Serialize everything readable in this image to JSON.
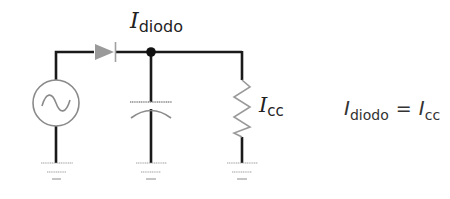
{
  "diagram": {
    "components": [
      {
        "id": "ac-source",
        "type": "ac_voltage_source"
      },
      {
        "id": "diode",
        "type": "diode"
      },
      {
        "id": "junction",
        "type": "node"
      },
      {
        "id": "capacitor",
        "type": "polarized_capacitor"
      },
      {
        "id": "load-resistor",
        "type": "resistor"
      },
      {
        "id": "ground-1",
        "type": "ground"
      },
      {
        "id": "ground-2",
        "type": "ground"
      },
      {
        "id": "ground-3",
        "type": "ground"
      }
    ],
    "colors": {
      "wire": "#1a1a1a",
      "component": "#8a8a8a"
    }
  },
  "labels": {
    "i_diodo": {
      "symbol": "I",
      "subscript": "diodo"
    },
    "i_cc": {
      "symbol": "I",
      "subscript": "cc"
    }
  },
  "equation": {
    "lhs_symbol": "I",
    "lhs_subscript": "diodo",
    "operator": "=",
    "rhs_symbol": "I",
    "rhs_subscript": "cc"
  }
}
